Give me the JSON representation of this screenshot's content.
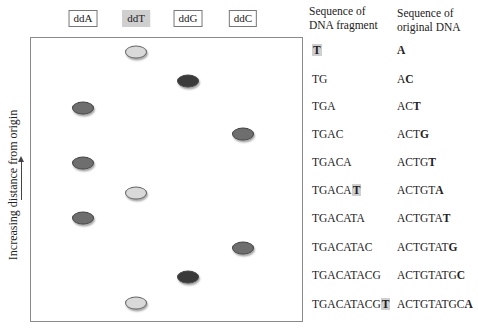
{
  "lanes": [
    {
      "label": "ddA",
      "x": 83,
      "highlighted": false
    },
    {
      "label": "ddT",
      "x": 136,
      "highlighted": true
    },
    {
      "label": "ddG",
      "x": 188,
      "highlighted": false
    },
    {
      "label": "ddC",
      "x": 243,
      "highlighted": false
    }
  ],
  "band_colors": {
    "ddA": "#6e6e6e",
    "ddT": "#d9d9d9",
    "ddG": "#3a3a3a",
    "ddC": "#6e6e6e"
  },
  "y_axis": {
    "label": "Increasing distance from origin"
  },
  "columns": {
    "fragment_header": [
      "Sequence of",
      "DNA fragment"
    ],
    "original_header": [
      "Sequence of",
      "original DNA"
    ]
  },
  "rows": [
    {
      "fragment": "T",
      "fragment_prefix": "",
      "fragment_last": "T",
      "fragment_last_highlight": true,
      "original_prefix": "",
      "original_last": "A",
      "lane": "ddT",
      "band_y": 52,
      "text_y": 43
    },
    {
      "fragment": "TG",
      "fragment_prefix": "TG",
      "fragment_last": "",
      "fragment_last_highlight": false,
      "original_prefix": "A",
      "original_last": "C",
      "lane": "ddG",
      "band_y": 81,
      "text_y": 72
    },
    {
      "fragment": "TGA",
      "fragment_prefix": "TGA",
      "fragment_last": "",
      "fragment_last_highlight": false,
      "original_prefix": "AC",
      "original_last": "T",
      "lane": "ddA",
      "band_y": 108,
      "text_y": 99
    },
    {
      "fragment": "TGAC",
      "fragment_prefix": "TGAC",
      "fragment_last": "",
      "fragment_last_highlight": false,
      "original_prefix": "ACT",
      "original_last": "G",
      "lane": "ddC",
      "band_y": 134,
      "text_y": 127
    },
    {
      "fragment": "TGACA",
      "fragment_prefix": "TGACA",
      "fragment_last": "",
      "fragment_last_highlight": false,
      "original_prefix": "ACTG",
      "original_last": "T",
      "lane": "ddA",
      "band_y": 163,
      "text_y": 155
    },
    {
      "fragment": "TGACAT",
      "fragment_prefix": "TGACA",
      "fragment_last": "T",
      "fragment_last_highlight": true,
      "original_prefix": "ACTGT",
      "original_last": "A",
      "lane": "ddT",
      "band_y": 193,
      "text_y": 183
    },
    {
      "fragment": "TGACATA",
      "fragment_prefix": "TGACATA",
      "fragment_last": "",
      "fragment_last_highlight": false,
      "original_prefix": "ACTGTA",
      "original_last": "T",
      "lane": "ddA",
      "band_y": 218,
      "text_y": 211
    },
    {
      "fragment": "TGACATAC",
      "fragment_prefix": "TGACATAC",
      "fragment_last": "",
      "fragment_last_highlight": false,
      "original_prefix": "ACTGTAT",
      "original_last": "G",
      "lane": "ddC",
      "band_y": 248,
      "text_y": 240
    },
    {
      "fragment": "TGACATACG",
      "fragment_prefix": "TGACATACG",
      "fragment_last": "",
      "fragment_last_highlight": false,
      "original_prefix": "ACTGTATG",
      "original_last": "C",
      "lane": "ddG",
      "band_y": 277,
      "text_y": 268
    },
    {
      "fragment": "TGACATACGT",
      "fragment_prefix": "TGACATACG",
      "fragment_last": "T",
      "fragment_last_highlight": true,
      "original_prefix": "ACTGTATGC",
      "original_last": "A",
      "lane": "ddT",
      "band_y": 303,
      "text_y": 297
    }
  ]
}
